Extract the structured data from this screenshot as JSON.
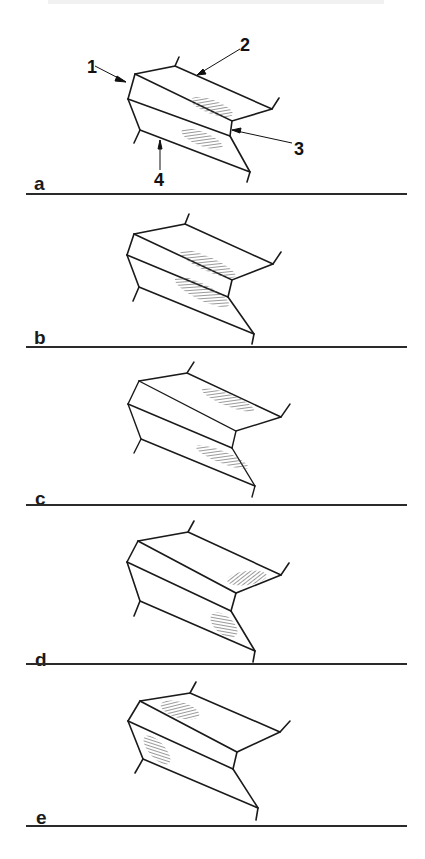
{
  "figure": {
    "panels": [
      {
        "id": "a",
        "label": "a",
        "hatch_regions": [
          "upper-middle",
          "lower-middle"
        ],
        "callouts": [
          {
            "num": "1"
          },
          {
            "num": "2"
          },
          {
            "num": "3"
          },
          {
            "num": "4"
          }
        ]
      },
      {
        "id": "b",
        "label": "b",
        "hatch_regions": [
          "upper-inner-edge",
          "lower-inner-edge"
        ]
      },
      {
        "id": "c",
        "label": "c",
        "hatch_regions": [
          "upper-outer",
          "lower-outer"
        ]
      },
      {
        "id": "d",
        "label": "d",
        "hatch_regions": [
          "upper-outer-tip",
          "lower-outer-tip"
        ]
      },
      {
        "id": "e",
        "label": "e",
        "hatch_regions": [
          "upper-root",
          "lower-root"
        ]
      }
    ],
    "colors": {
      "ink": "#1a1a1a",
      "hatch": "#555555",
      "background": "#ffffff"
    }
  }
}
